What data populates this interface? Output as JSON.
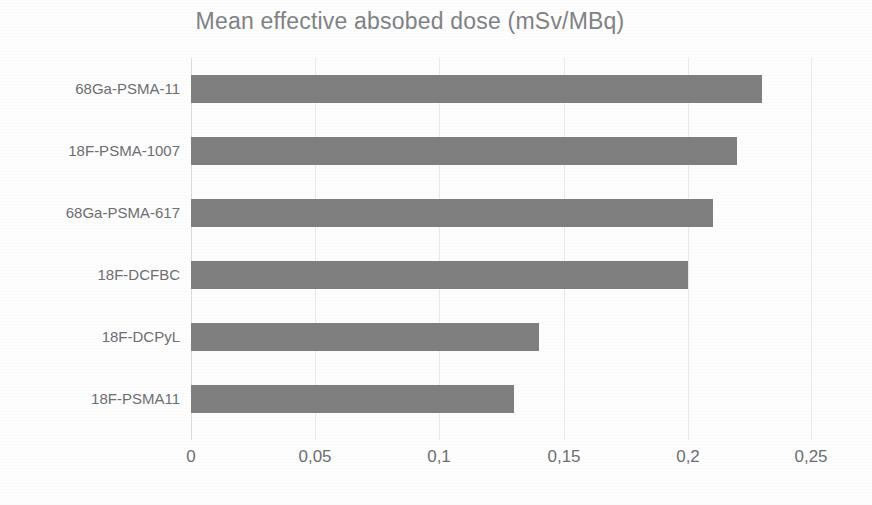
{
  "chart_data": {
    "type": "bar",
    "orientation": "horizontal",
    "title": "Mean effective absobed dose (mSv/MBq)",
    "xlabel": "",
    "ylabel": "",
    "categories": [
      "68Ga-PSMA-11",
      "18F-PSMA-1007",
      "68Ga-PSMA-617",
      "18F-DCFBC",
      "18F-DCPyL",
      "18F-PSMA11"
    ],
    "values": [
      0.23,
      0.22,
      0.21,
      0.2,
      0.14,
      0.13
    ],
    "value_labels": [
      "0,23",
      "0,22",
      "0,21",
      "0,2",
      "0,14",
      "0,13"
    ],
    "xlim": [
      0,
      0.25
    ],
    "xticks": [
      0,
      0.05,
      0.1,
      0.15,
      0.2,
      0.25
    ],
    "xtick_labels": [
      "0",
      "0,05",
      "0,1",
      "0,15",
      "0,2",
      "0,25"
    ],
    "decimal_separator": ",",
    "grid": "vertical",
    "legend": "none",
    "bar_color": "#7f7f7f",
    "gridline_color": "#e9e9ea",
    "text_color": "#6d6e71",
    "title_color": "#808285",
    "background": "#ffffff"
  }
}
